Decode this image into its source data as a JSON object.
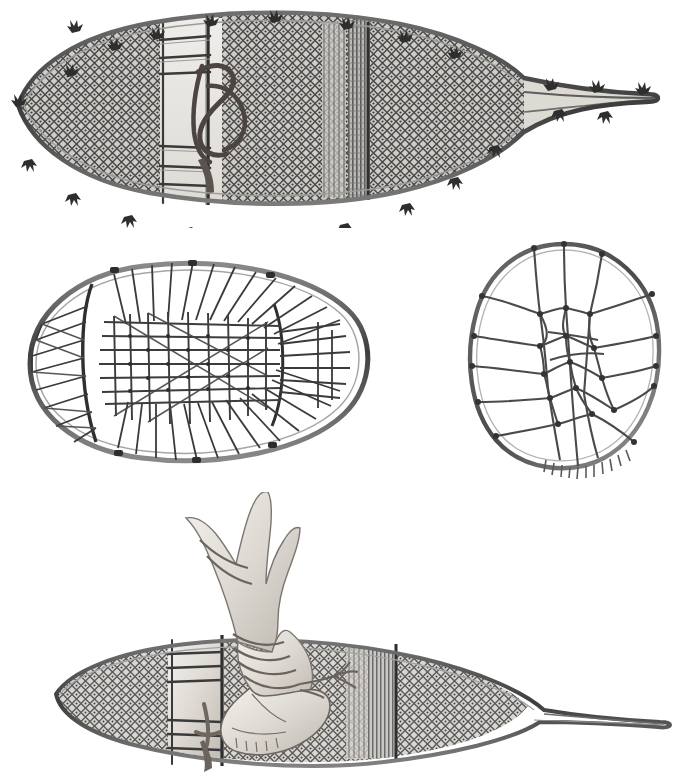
{
  "plate": {
    "title": "Snowshoes",
    "medium": "grayscale ethnographic line-and-wash illustration",
    "background_color": "#ffffff",
    "ink_color": "#3a3a3a",
    "shade_color": "#8d8d8d",
    "light_fill": "#e8e6e2",
    "figure_count": 4
  },
  "figures": [
    {
      "id": "fig-top",
      "name": "long-pointed-tail-snowshoe",
      "caption": "Long pointed-tail snowshoe, upper view",
      "position": "top",
      "orientation": "horizontal, toe at left, tail at right",
      "frame_shape": "elongated teardrop with drawn-out tail",
      "mesh": "fine diamond babiche netting",
      "crossbars": 2,
      "toe_hole": "rectangular opening with lashed binding thong",
      "edge_ornaments": "tufts of fringe along outer frame",
      "tail_ties": 5
    },
    {
      "id": "fig-mid-left",
      "name": "oval-bearpaw-snowshoe",
      "caption": "Oval bear-paw snowshoe with radial lacing",
      "position": "middle-left",
      "orientation": "horizontal, toe at left, heel at right",
      "frame_shape": "broad oval / teardrop",
      "mesh": "coarse rectangular centre grid with radiating side cords",
      "crossbars": 2,
      "toe_hole": "open centre grid panel",
      "edge_ornaments": "none",
      "tail_ties": 0
    },
    {
      "id": "fig-mid-right",
      "name": "round-bearpaw-snowshoe",
      "caption": "Round bear-paw snowshoe with coarse irregular web",
      "position": "middle-right",
      "orientation": "upright, nearly circular",
      "frame_shape": "rounded, slightly flattened at base",
      "mesh": "coarse irregular hexagonal web with knotted junctions",
      "crossbars": 0,
      "toe_hole": "none",
      "edge_ornaments": "whipped binding stitches along lower rim",
      "tail_ties": 0
    },
    {
      "id": "fig-bottom",
      "name": "snowshoe-with-moccasin-foot",
      "caption": "Snowshoe worn on a moccasin-clad foot with wrapped legging",
      "position": "bottom",
      "orientation": "three-quarter view, toe at left, tail at right",
      "frame_shape": "elongated teardrop with drawn-out tail",
      "mesh": "fine diamond babiche netting",
      "crossbars": 2,
      "toe_hole": "rectangular opening occupied by the moccasin toe",
      "edge_ornaments": "none",
      "tail_ties": 0,
      "foot": {
        "name": "moccasin-and-legging",
        "parts": [
          "moccasin",
          "wrapped legging",
          "binding thong",
          "thong tassel"
        ]
      }
    }
  ]
}
